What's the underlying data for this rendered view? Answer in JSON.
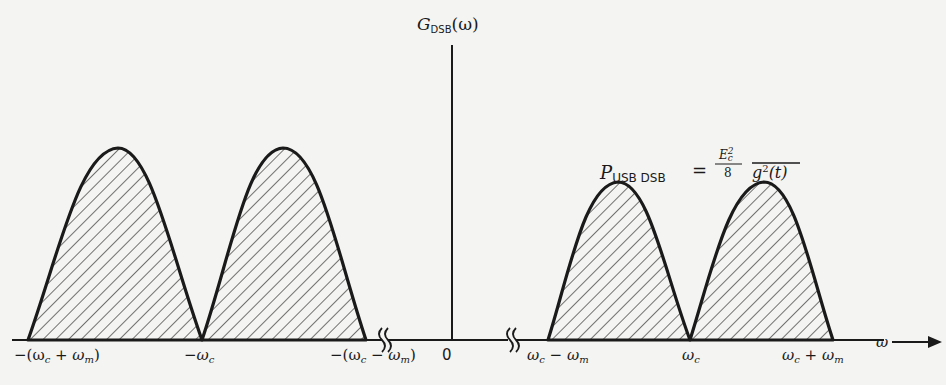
{
  "figure": {
    "y_axis_label": {
      "symbol": "G",
      "subscript": "DSB",
      "argument": "(ω)"
    },
    "x_axis_label": "ω",
    "power_equation": {
      "lhs_symbol": "P",
      "lhs_subscript": "USB DSB",
      "equals": "=",
      "numerator": "E",
      "numerator_sub": "c",
      "numerator_sup": "2",
      "denominator": "8",
      "overbar_expr": "g",
      "overbar_sup": "2",
      "overbar_arg": "(t)"
    },
    "x_ticks": [
      {
        "id": "neg_wc_plus_wm",
        "text": "−(ω",
        "sub": "c",
        "rest": " + ω",
        "sub2": "m",
        "close": ")"
      },
      {
        "id": "neg_wc",
        "text": "−ω",
        "sub": "c"
      },
      {
        "id": "neg_wc_minus_wm",
        "text": "−(ω",
        "sub": "c",
        "rest": " − ω",
        "sub2": "m",
        "close": ")"
      },
      {
        "id": "zero",
        "text": "0"
      },
      {
        "id": "wc_minus_wm",
        "text": "ω",
        "sub": "c",
        "rest": " − ω",
        "sub2": "m"
      },
      {
        "id": "wc",
        "text": "ω",
        "sub": "c"
      },
      {
        "id": "wc_plus_wm",
        "text": "ω",
        "sub": "c",
        "rest": " + ω",
        "sub2": "m"
      }
    ],
    "axis_breaks": [
      "left-break",
      "right-break"
    ],
    "spectrum_lobes": [
      {
        "side": "negative",
        "band": "LSB-outer",
        "x_start": 28,
        "x_peak": 118,
        "x_end": 202,
        "peak_y": 148
      },
      {
        "side": "negative",
        "band": "inner",
        "x_start": 202,
        "x_peak": 283,
        "x_end": 366,
        "peak_y": 148
      },
      {
        "side": "positive",
        "band": "inner",
        "x_start": 548,
        "x_peak": 618,
        "x_end": 690,
        "peak_y": 182
      },
      {
        "side": "positive",
        "band": "USB-outer",
        "x_start": 690,
        "x_peak": 764,
        "x_end": 833,
        "peak_y": 182
      }
    ]
  }
}
